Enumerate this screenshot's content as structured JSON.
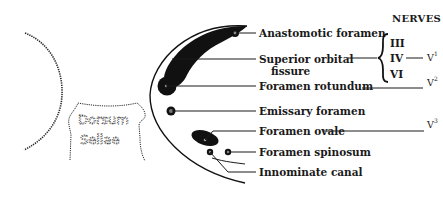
{
  "diagram": {
    "left_structure": {
      "label_line1": "Dorsum",
      "label_line2": "Sellae"
    },
    "labels": {
      "anastomotic_foramen": "Anastomotic foramen",
      "superior_orbital_fissure_line1": "Superior orbital",
      "superior_orbital_fissure_line2": "fissure",
      "foramen_rotundum": "Foramen rotundum",
      "emissary_foramen": "Emissary foramen",
      "foramen_ovale": "Foramen ovale",
      "foramen_spinosum": "Foramen spinosum",
      "innominate_canal": "Innominate canal"
    },
    "nerves": {
      "header": "NERVES",
      "iii": "III",
      "iv": "IV",
      "vi": "VI",
      "v1_base": "V",
      "v1_sup": "1",
      "v2_base": "V",
      "v2_sup": "2",
      "v3_base": "V",
      "v3_sup": "3"
    }
  }
}
